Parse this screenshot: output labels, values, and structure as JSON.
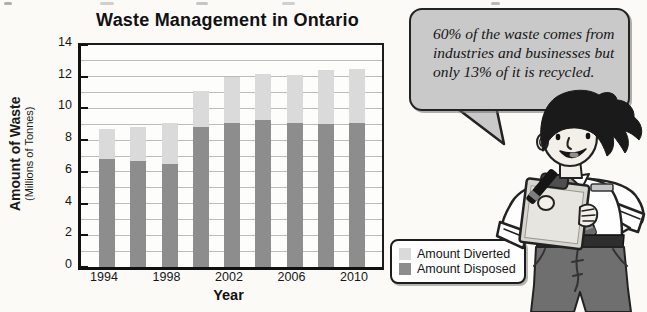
{
  "title": "Waste Management in Ontario",
  "chart_data": {
    "type": "bar",
    "stacked": true,
    "title": "Waste Management in Ontario",
    "xlabel": "Year",
    "ylabel": "Amount of Waste",
    "ylabel_sub": "(Millions of Tonnes)",
    "categories": [
      1994,
      1996,
      1998,
      2000,
      2002,
      2004,
      2006,
      2008,
      2010
    ],
    "series": [
      {
        "name": "Amount Disposed",
        "color": "#8d8d8d",
        "values": [
          6.8,
          6.7,
          6.5,
          8.8,
          9.1,
          9.3,
          9.1,
          9.0,
          9.1
        ]
      },
      {
        "name": "Amount Diverted",
        "color": "#dadada",
        "values": [
          1.9,
          2.1,
          2.6,
          2.3,
          2.9,
          2.9,
          3.0,
          3.4,
          3.4
        ]
      }
    ],
    "totals": [
      8.7,
      8.8,
      9.1,
      11.1,
      12.0,
      12.2,
      12.1,
      12.4,
      12.5
    ],
    "ylim": [
      0,
      14
    ],
    "y_ticks": [
      0,
      2,
      4,
      6,
      8,
      10,
      12,
      14
    ],
    "gridlines_every": 1,
    "x_tick_labels": [
      "1994",
      "1998",
      "2002",
      "2006",
      "2010"
    ],
    "legend_position": "outside-bottom-right"
  },
  "legend": {
    "items": [
      {
        "label": "Amount Diverted",
        "color": "#dadada"
      },
      {
        "label": "Amount Disposed",
        "color": "#8d8d8d"
      }
    ]
  },
  "speech_bubble": {
    "text": "60% of the waste comes from industries and businesses but only 13% of it is recycled.",
    "fill_color": "#c9c9c9"
  },
  "illustration": "man-with-clipboard-and-marker"
}
